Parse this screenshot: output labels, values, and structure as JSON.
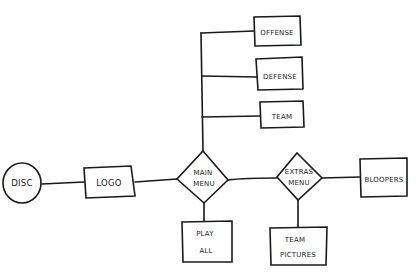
{
  "diagram": {
    "type": "flowchart",
    "style": "hand-drawn",
    "stroke_color": "#1a1a1a",
    "background": "#ffffff",
    "nodes": [
      {
        "id": "disc",
        "shape": "circle",
        "label": "DISC"
      },
      {
        "id": "logo",
        "shape": "rectangle",
        "label": "LOGO"
      },
      {
        "id": "main_menu",
        "shape": "diamond",
        "label_line1": "MAIN",
        "label_line2": "MENU"
      },
      {
        "id": "offense",
        "shape": "rectangle",
        "label": "OFFENSE"
      },
      {
        "id": "defense",
        "shape": "rectangle",
        "label": "DEFENSE"
      },
      {
        "id": "team",
        "shape": "rectangle",
        "label": "TEAM"
      },
      {
        "id": "play_all",
        "shape": "rectangle",
        "label_line1": "PLAY",
        "label_line2": "ALL"
      },
      {
        "id": "extras_menu",
        "shape": "diamond",
        "label_line1": "EXTRAS",
        "label_line2": "MENU"
      },
      {
        "id": "bloopers",
        "shape": "rectangle",
        "label": "BLOOPERS"
      },
      {
        "id": "team_pictures",
        "shape": "rectangle",
        "label_line1": "TEAM",
        "label_line2": "PICTURES"
      }
    ],
    "edges": [
      {
        "from": "disc",
        "to": "logo"
      },
      {
        "from": "logo",
        "to": "main_menu"
      },
      {
        "from": "main_menu",
        "to": "offense"
      },
      {
        "from": "main_menu",
        "to": "defense"
      },
      {
        "from": "main_menu",
        "to": "team"
      },
      {
        "from": "main_menu",
        "to": "play_all"
      },
      {
        "from": "main_menu",
        "to": "extras_menu"
      },
      {
        "from": "extras_menu",
        "to": "bloopers"
      },
      {
        "from": "extras_menu",
        "to": "team_pictures"
      }
    ]
  },
  "labels": {
    "disc": "DISC",
    "logo": "LOGO",
    "main_menu_1": "MAIN",
    "main_menu_2": "MENU",
    "offense": "OFFENSE",
    "defense": "DEFENSE",
    "team": "TEAM",
    "play_all_1": "PLAY",
    "play_all_2": "ALL",
    "extras_menu_1": "EXTRAS",
    "extras_menu_2": "MENU",
    "bloopers": "BLOOPERS",
    "team_pictures_1": "TEAM",
    "team_pictures_2": "PICTURES"
  }
}
